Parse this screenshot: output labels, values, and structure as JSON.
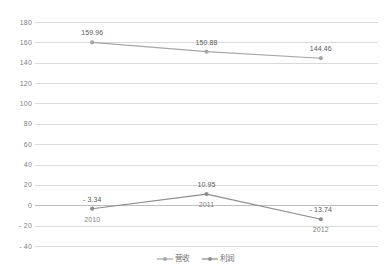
{
  "chart_data": {
    "type": "line",
    "title": "",
    "subtitle": "",
    "xlabel": "",
    "ylabel": "",
    "categories": [
      "2010",
      "2011",
      "2012"
    ],
    "series": [
      {
        "name": "营收",
        "values": [
          159.96,
          150.88,
          144.46
        ],
        "labels": [
          "159.96",
          "150.88",
          "144.46"
        ],
        "color": "#a6a6a6",
        "marker": "circle"
      },
      {
        "name": "利润",
        "values": [
          -3.34,
          10.95,
          -13.74
        ],
        "labels": [
          "- 3.34",
          "10.95",
          "- 13.74"
        ],
        "color": "#8c8c8c",
        "marker": "circle"
      }
    ],
    "ylim": [
      -40,
      180
    ],
    "ytick_step": 20,
    "yticks": [
      "180",
      "160",
      "140",
      "120",
      "100",
      "80",
      "60",
      "40",
      "20",
      "0",
      "- 20",
      "- 40"
    ],
    "grid": true,
    "grid_color": "#d9d9d9",
    "zero_line_color": "#bfbfbf",
    "legend_position": "bottom",
    "background": "#ffffff",
    "data_labels_shown": true
  },
  "legend": {
    "items": [
      {
        "label": "营收",
        "symbol": "line-marker-icon",
        "color": "#a6a6a6"
      },
      {
        "label": "利润",
        "symbol": "line-marker-icon",
        "color": "#8c8c8c"
      }
    ]
  }
}
